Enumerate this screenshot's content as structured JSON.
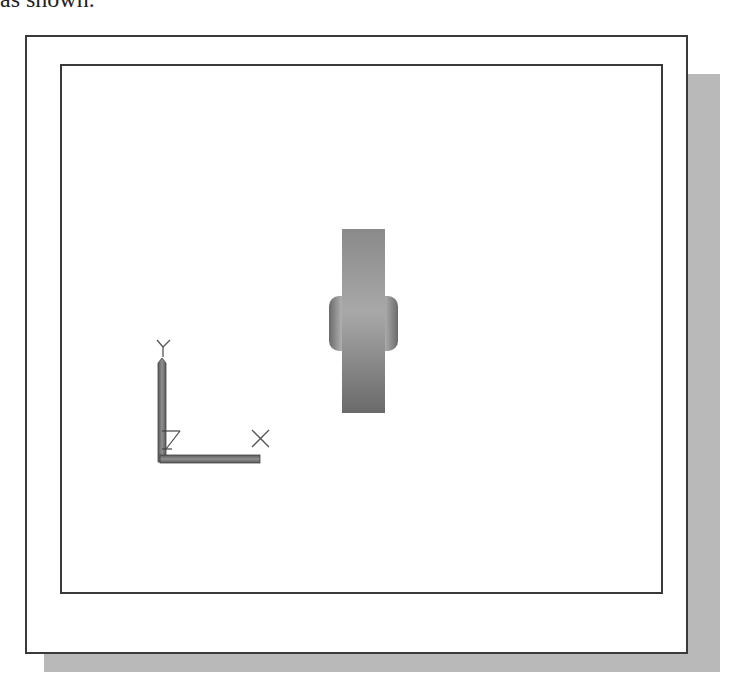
{
  "caption": {
    "text": "as shown."
  },
  "viewport": {
    "ucs_icon": {
      "y_label": "Y",
      "x_label": "X",
      "z_label": "Z"
    },
    "model": {
      "name": "side-view-part",
      "color_light": "#b5b5b5",
      "color_dark": "#6a6a6a"
    }
  },
  "colors": {
    "frame": "#3a3a3a",
    "shadow": "#b9b9b9",
    "background": "#ffffff"
  }
}
